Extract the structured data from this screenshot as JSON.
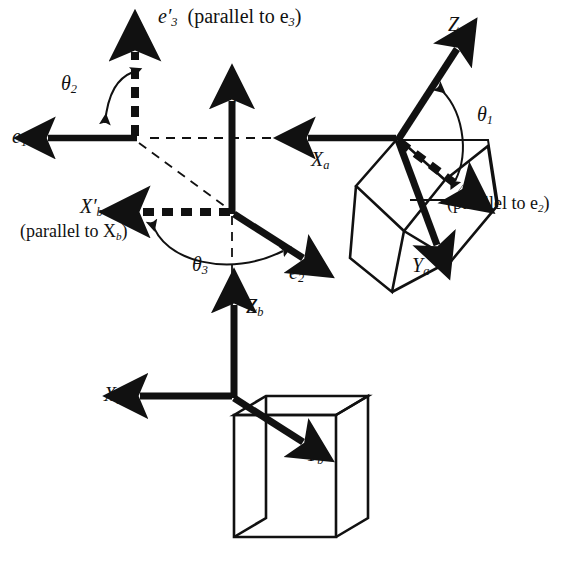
{
  "figure": {
    "kind": "coordinate-frame-rotation-diagram",
    "background": "#ffffff",
    "ink": "#111111",
    "width": 573,
    "height": 574
  },
  "labels": {
    "e1": "e",
    "e1_sub": "1",
    "e2": "e",
    "e2_sub": "2",
    "e3": "e",
    "e3_sub": "3",
    "e3p_main": "e",
    "e3p_sub": "3",
    "e3p_paren": "(parallel to e",
    "e3p_paren_sub": "3",
    "e3p_paren_end": ")",
    "e2p_main": "e",
    "e2p_sub": "2",
    "e2p_paren": "(parallel to e",
    "e2p_paren_sub": "2",
    "e2p_paren_end": ")",
    "Xa": "X",
    "Xa_sub": "a",
    "Ya": "Y",
    "Ya_sub": "a",
    "Za": "Z",
    "Za_sub": "a",
    "Xb": "X",
    "Xb_sub": "b",
    "Yb": "Y",
    "Yb_sub": "b",
    "Zb": "Z",
    "Zb_sub": "b",
    "Xbp_main": "X",
    "Xbp_sub": "b",
    "Xbp_paren": "(parallel to X",
    "Xbp_paren_sub": "b",
    "Xbp_paren_end": ")",
    "theta1": "θ",
    "theta1_sub": "1",
    "theta2": "θ",
    "theta2_sub": "2",
    "theta3": "θ",
    "theta3_sub": "3",
    "prime": "′"
  },
  "frames": [
    {
      "name": "e-prime-frame",
      "origin": [
        135,
        138
      ],
      "axes": [
        {
          "id": "e1",
          "style": "solid",
          "dir": "left"
        },
        {
          "id": "e3-prime",
          "style": "dashed",
          "dir": "up"
        }
      ],
      "angle": {
        "id": "theta2",
        "between": [
          "e1",
          "e3-prime"
        ]
      }
    },
    {
      "name": "e-frame",
      "origin": [
        232,
        212
      ],
      "axes": [
        {
          "id": "e3",
          "style": "solid",
          "dir": "up"
        },
        {
          "id": "e2",
          "style": "solid",
          "dir": "down-right"
        },
        {
          "id": "Xb-prime",
          "style": "dashed",
          "dir": "left"
        }
      ],
      "angle": {
        "id": "theta3",
        "between": [
          "Xb-prime",
          "e2"
        ]
      }
    },
    {
      "name": "a-frame",
      "origin": [
        398,
        138
      ],
      "axes": [
        {
          "id": "Xa",
          "style": "solid",
          "dir": "left"
        },
        {
          "id": "Za",
          "style": "solid",
          "dir": "up-right"
        },
        {
          "id": "Ya",
          "style": "solid",
          "dir": "down-right"
        },
        {
          "id": "e2-prime",
          "style": "dashed",
          "dir": "down-right"
        }
      ],
      "angle": {
        "id": "theta1",
        "between": [
          "Za",
          "e2-prime"
        ]
      },
      "body": "tilted-cube"
    },
    {
      "name": "b-frame",
      "origin": [
        234,
        396
      ],
      "axes": [
        {
          "id": "Zb",
          "style": "solid",
          "dir": "up"
        },
        {
          "id": "Xb",
          "style": "solid",
          "dir": "left"
        },
        {
          "id": "Yb",
          "style": "solid",
          "dir": "down-right"
        }
      ],
      "body": "upright-cube"
    }
  ],
  "guides": [
    {
      "name": "horizontal-dashed-e1-to-a",
      "from": [
        135,
        138
      ],
      "to": [
        398,
        138
      ]
    },
    {
      "name": "diagonal-dashed-e1-to-e-origin",
      "from": [
        137,
        140
      ],
      "to": [
        232,
        212
      ]
    },
    {
      "name": "vertical-dashed-e-origin-to-b",
      "from": [
        232,
        214
      ],
      "to": [
        232,
        400
      ]
    }
  ]
}
